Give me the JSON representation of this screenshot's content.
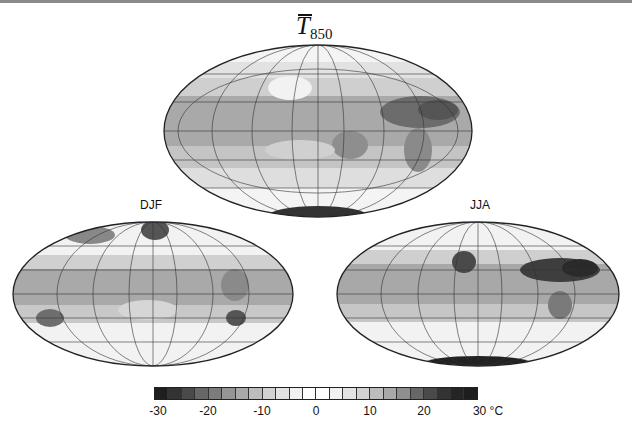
{
  "figure": {
    "title_symbol": "T",
    "title_subscript": "850",
    "panels": [
      {
        "id": "annual",
        "label": ""
      },
      {
        "id": "djf",
        "label": "DJF"
      },
      {
        "id": "jja",
        "label": "JJA"
      }
    ]
  },
  "colorbar": {
    "unit": "°C",
    "min": -30,
    "max": 30,
    "n_boxes": 24,
    "tick_labels": [
      "-30",
      "-20",
      "-10",
      "0",
      "10",
      "20",
      "30 °C"
    ],
    "colors": [
      "#1e1e1e",
      "#333333",
      "#4a4a4a",
      "#676767",
      "#7c7c7c",
      "#959595",
      "#a9a9a9",
      "#bdbdbd",
      "#d2d2d2",
      "#e3e3e3",
      "#f1f1f1",
      "#ffffff",
      "#ffffff",
      "#f1f1f1",
      "#e3e3e3",
      "#d2d2d2",
      "#bdbdbd",
      "#a9a9a9",
      "#8f8f8f",
      "#676767",
      "#4a4a4a",
      "#333333",
      "#252525",
      "#1e1e1e"
    ]
  },
  "chart_data": {
    "type": "heatmap",
    "panels": [
      "Annual (top)",
      "DJF",
      "JJA"
    ],
    "projection": "Hammer/Mollweide global, Pacific-centered at ~0°, with graticule",
    "colorbar": {
      "range": [
        -30,
        30
      ],
      "unit": "°C",
      "ticks": [
        -30,
        -20,
        -10,
        0,
        10,
        20,
        30
      ],
      "levels": 24,
      "colormap": "grayscale diverging (dark at both extremes, white near 0)"
    },
    "xlabel": "",
    "ylabel": ""
  }
}
